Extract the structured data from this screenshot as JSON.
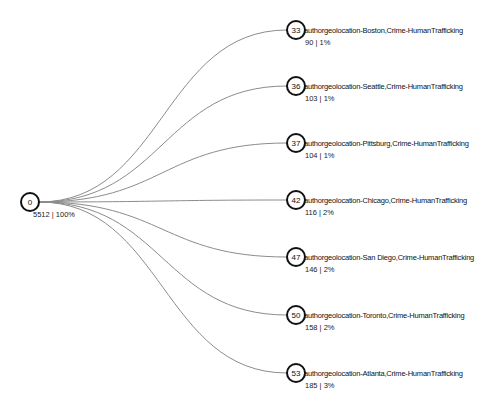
{
  "diagram": {
    "type": "tree",
    "orientation": "horizontal",
    "root": {
      "id": "0",
      "value_label": "5512 | 100%",
      "count": 5512,
      "percent": "100%",
      "x": 30,
      "y": 202
    },
    "children": [
      {
        "id": "33",
        "label": "authorgeolocation-Boston,Crime-HumanTrafficking",
        "value_label": "90 | 1%",
        "count": 90,
        "percent": "1%",
        "x": 296,
        "y": 30
      },
      {
        "id": "36",
        "label": "authorgeolocation-Seattle,Crime-HumanTrafficking",
        "value_label": "103 | 1%",
        "count": 103,
        "percent": "1%",
        "x": 296,
        "y": 86
      },
      {
        "id": "37",
        "label": "authorgeolocation-Pittsburg,Crime-HumanTrafficking",
        "value_label": "104 | 1%",
        "count": 104,
        "percent": "1%",
        "x": 296,
        "y": 143
      },
      {
        "id": "42",
        "label": "authorgeolocation-Chicago,Crime-HumanTrafficking",
        "value_label": "116 | 2%",
        "count": 116,
        "percent": "2%",
        "x": 296,
        "y": 200
      },
      {
        "id": "47",
        "label": "authorgeolocation-San Diego,Crime-HumanTrafficking",
        "value_label": "146 | 2%",
        "count": 146,
        "percent": "2%",
        "x": 296,
        "y": 257
      },
      {
        "id": "50",
        "label": "authorgeolocation-Toronto,Crime-HumanTrafficking",
        "value_label": "158 | 2%",
        "count": 158,
        "percent": "2%",
        "x": 296,
        "y": 315
      },
      {
        "id": "53",
        "label": "authorgeolocation-Atlanta,Crime-HumanTrafficking",
        "value_label": "185 | 3%",
        "count": 185,
        "percent": "3%",
        "x": 296,
        "y": 373
      }
    ]
  },
  "style": {
    "link_color": "#8c8c8c",
    "node_stroke": "#111111",
    "node_fill": "#ffffff",
    "text_color": "#111111",
    "background": "#ffffff"
  }
}
